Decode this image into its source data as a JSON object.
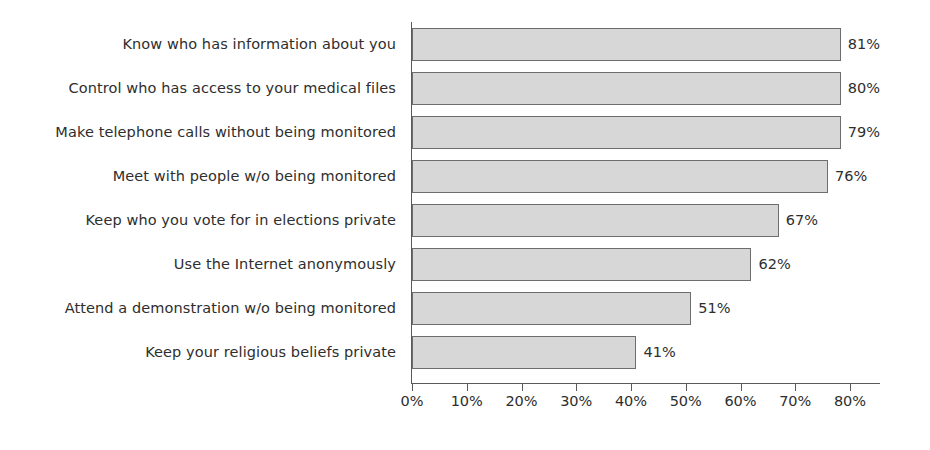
{
  "chart_data": {
    "type": "bar",
    "orientation": "horizontal",
    "title": "",
    "subtitle": "",
    "xlabel": "",
    "ylabel": "",
    "xlim": [
      0,
      80
    ],
    "grid": false,
    "legend": null,
    "categories": [
      "Know who has information about you",
      "Control who has access to your medical files",
      "Make telephone calls without being monitored",
      "Meet with people w/o being monitored",
      "Keep who you vote for in elections private",
      "Use the Internet anonymously",
      "Attend a demonstration w/o being monitored",
      "Keep your religious beliefs private"
    ],
    "values": [
      81,
      80,
      79,
      76,
      67,
      62,
      51,
      41
    ],
    "value_labels": [
      "81%",
      "80%",
      "79%",
      "76%",
      "67%",
      "62%",
      "51%",
      "41%"
    ],
    "xticks": [
      0,
      10,
      20,
      30,
      40,
      50,
      60,
      70,
      80
    ],
    "xtick_labels": [
      "0%",
      "10%",
      "20%",
      "30%",
      "40%",
      "50%",
      "60%",
      "70%",
      "80%"
    ],
    "colors": {
      "bar_fill": "#d7d7d7",
      "bar_border": "#6d6d6d",
      "axis": "#5a5a5a",
      "text": "#2e2e2e",
      "background": "#ffffff"
    }
  }
}
